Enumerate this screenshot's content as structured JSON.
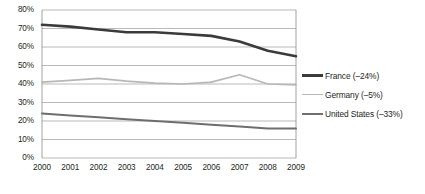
{
  "chart_data": {
    "type": "line",
    "title": "",
    "subtitle": "",
    "xlabel": "",
    "ylabel": "",
    "categories": [
      "2000",
      "2001",
      "2002",
      "2003",
      "2004",
      "2005",
      "2006",
      "2007",
      "2008",
      "2009"
    ],
    "x": [
      2000,
      2001,
      2002,
      2003,
      2004,
      2005,
      2006,
      2007,
      2008,
      2009
    ],
    "ylim": [
      0,
      80
    ],
    "ytick_values": [
      0,
      10,
      20,
      30,
      40,
      50,
      60,
      70,
      80
    ],
    "ytick_labels": [
      "0%",
      "10%",
      "20%",
      "30%",
      "40%",
      "50%",
      "60%",
      "70%",
      "80%"
    ],
    "grid": "horizontal",
    "legend_position": "right",
    "series": [
      {
        "name": "France (–24%)",
        "label": "France (–24%)",
        "color": "#3b3b3b",
        "width": 2.6,
        "values": [
          72,
          71,
          69.5,
          68,
          68,
          67,
          66,
          63,
          58,
          55
        ]
      },
      {
        "name": "Germany (–5%)",
        "label": "Germany (–5%)",
        "color": "#b7b7b7",
        "width": 1.7,
        "values": [
          41,
          42,
          43,
          41.5,
          40.5,
          40,
          41,
          45,
          40,
          39.5
        ]
      },
      {
        "name": "United States (–33%)",
        "label": "United States (–33%)",
        "color": "#6e6e6e",
        "width": 2.0,
        "values": [
          24,
          23,
          22,
          21,
          20,
          19,
          18,
          17,
          16,
          16
        ]
      }
    ]
  },
  "axes": {
    "gridline_color": "#a7a7a7",
    "axis_color": "#8a8a8a"
  }
}
